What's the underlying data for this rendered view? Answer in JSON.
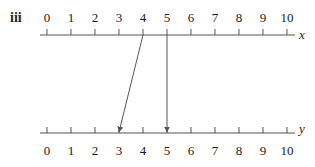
{
  "part_label": "iii",
  "top_axis": {
    "name": "x",
    "ticks": [
      "0",
      "1",
      "2",
      "3",
      "4",
      "5",
      "6",
      "7",
      "8",
      "9",
      "10"
    ]
  },
  "bottom_axis": {
    "name": "y",
    "ticks": [
      "0",
      "1",
      "2",
      "3",
      "4",
      "5",
      "6",
      "7",
      "8",
      "9",
      "10"
    ]
  },
  "mappings": [
    {
      "from": 4,
      "to": 3
    },
    {
      "from": 5,
      "to": 5
    }
  ],
  "colors": {
    "line": "#555555",
    "text": "#1a1a1a"
  }
}
